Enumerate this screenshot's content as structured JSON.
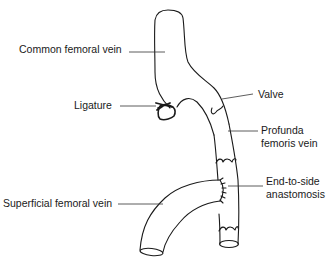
{
  "diagram": {
    "labels": {
      "common_femoral_vein": "Common femoral vein",
      "ligature": "Ligature",
      "valve": "Valve",
      "profunda_line1": "Profunda",
      "profunda_line2": "femoris vein",
      "anastomosis_line1": "End-to-side",
      "anastomosis_line2": "anastomosis",
      "superficial_femoral_vein": "Superficial femoral vein"
    },
    "colors": {
      "stroke": "#1a1a1a",
      "background": "#ffffff"
    }
  }
}
